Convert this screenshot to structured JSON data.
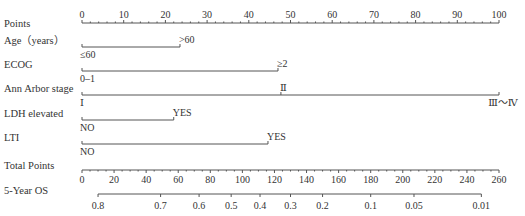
{
  "chart_data": {
    "type": "nomogram",
    "title": "",
    "points_axis": {
      "label": "Points",
      "min": 0,
      "max": 100,
      "major_ticks": [
        0,
        10,
        20,
        30,
        40,
        50,
        60,
        70,
        80,
        90,
        100
      ],
      "minor_step": 2
    },
    "variables": [
      {
        "label": "Age（years）",
        "levels": [
          {
            "name": "≤60",
            "points": 0,
            "pos": "below"
          },
          {
            "name": ">60",
            "points": 23.5,
            "pos": "above"
          }
        ]
      },
      {
        "label": "ECOG",
        "levels": [
          {
            "name": "0–1",
            "points": 0,
            "pos": "below"
          },
          {
            "name": "≥2",
            "points": 47,
            "pos": "above"
          }
        ]
      },
      {
        "label": "Ann Arbor stage",
        "levels": [
          {
            "name": "Ⅰ",
            "points": 0,
            "pos": "below"
          },
          {
            "name": "Ⅱ",
            "points": 47.7,
            "pos": "above"
          },
          {
            "name": "Ⅲ～Ⅳ",
            "points": 100,
            "pos": "below"
          }
        ]
      },
      {
        "label": "LDH elevated",
        "levels": [
          {
            "name": "NO",
            "points": 0,
            "pos": "below"
          },
          {
            "name": "YES",
            "points": 22,
            "pos": "above"
          }
        ]
      },
      {
        "label": "LTI",
        "levels": [
          {
            "name": "NO",
            "points": 0,
            "pos": "below"
          },
          {
            "name": "YES",
            "points": 44.6,
            "pos": "above"
          }
        ]
      }
    ],
    "total_points_axis": {
      "label": "Total Points",
      "min": 0,
      "max": 260,
      "major_ticks": [
        0,
        20,
        40,
        60,
        80,
        100,
        120,
        140,
        160,
        180,
        200,
        220,
        240,
        260
      ],
      "minor_step": 5
    },
    "survival_axis": {
      "label": "5-Year OS",
      "ticks": [
        {
          "value": "0.8",
          "total_points": 10
        },
        {
          "value": "0.7",
          "total_points": 49
        },
        {
          "value": "0.6",
          "total_points": 73
        },
        {
          "value": "0.5",
          "total_points": 93
        },
        {
          "value": "0.4",
          "total_points": 111
        },
        {
          "value": "0.3",
          "total_points": 130
        },
        {
          "value": "0.2",
          "total_points": 150
        },
        {
          "value": "0.1",
          "total_points": 180
        },
        {
          "value": "0.05",
          "total_points": 207
        },
        {
          "value": "0.01",
          "total_points": 249
        }
      ],
      "line_range_total_points": [
        10,
        249
      ]
    },
    "xlabel": "",
    "ylabel": "",
    "grid": false,
    "legend": "none"
  }
}
